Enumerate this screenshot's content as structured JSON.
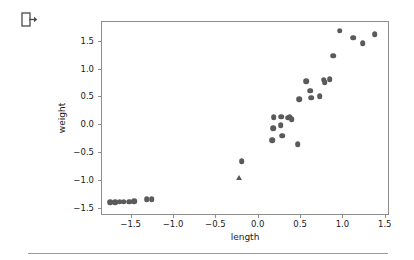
{
  "toolbar": {
    "logout_icon": "logout-icon"
  },
  "chart_data": {
    "type": "scatter",
    "title": "",
    "xlabel": "length",
    "ylabel": "weight",
    "xlim": [
      -1.85,
      1.55
    ],
    "ylim": [
      -1.62,
      1.85
    ],
    "xticks": [
      -1.5,
      -1.0,
      -0.5,
      0.0,
      0.5,
      1.0,
      1.5
    ],
    "xticklabels": [
      "-1.5",
      "-1.0",
      "-0.5",
      "0.0",
      "0.5",
      "1.0",
      "1.5"
    ],
    "yticks": [
      -1.5,
      -1.0,
      -0.5,
      0.0,
      0.5,
      1.0,
      1.5
    ],
    "yticklabels": [
      "-1.5",
      "-1.0",
      "-0.5",
      "0.0",
      "0.5",
      "1.0",
      "1.5"
    ],
    "grid": false,
    "legend": null,
    "marker_color": "#5a5a5a",
    "series": [
      {
        "name": "circles",
        "marker": "circle",
        "points": [
          [
            -1.74,
            -1.39
          ],
          [
            -1.68,
            -1.39
          ],
          [
            -1.63,
            -1.38
          ],
          [
            -1.58,
            -1.38
          ],
          [
            -1.52,
            -1.38
          ],
          [
            -1.46,
            -1.37
          ],
          [
            -1.31,
            -1.34
          ],
          [
            -1.25,
            -1.34
          ],
          [
            -0.19,
            -0.66
          ],
          [
            0.17,
            -0.28
          ],
          [
            0.18,
            -0.07
          ],
          [
            0.19,
            0.13
          ],
          [
            0.27,
            -0.01
          ],
          [
            0.28,
            0.14
          ],
          [
            0.29,
            -0.2
          ],
          [
            0.36,
            0.12
          ],
          [
            0.38,
            0.13
          ],
          [
            0.4,
            0.09
          ],
          [
            0.47,
            -0.35
          ],
          [
            0.49,
            0.45
          ],
          [
            0.57,
            0.77
          ],
          [
            0.62,
            0.6
          ],
          [
            0.63,
            0.48
          ],
          [
            0.73,
            0.51
          ],
          [
            0.78,
            0.8
          ],
          [
            0.79,
            0.76
          ],
          [
            0.85,
            0.81
          ],
          [
            0.89,
            1.23
          ],
          [
            0.97,
            1.68
          ],
          [
            1.13,
            1.55
          ],
          [
            1.24,
            1.45
          ],
          [
            1.38,
            1.61
          ]
        ]
      },
      {
        "name": "triangles",
        "marker": "triangle",
        "points": [
          [
            -0.22,
            -0.95
          ]
        ]
      }
    ]
  }
}
